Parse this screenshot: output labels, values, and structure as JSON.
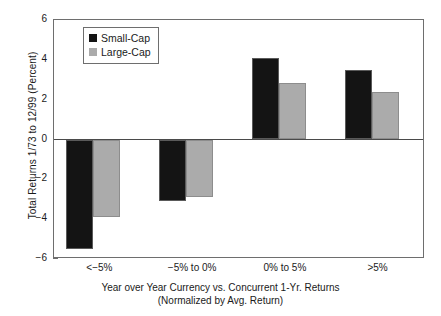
{
  "chart_data": {
    "type": "bar",
    "title": "",
    "xlabel": "Year over Year Currency vs. Concurrent 1-Yr. Returns (Normalized by Avg. Return)",
    "xlabel_line1": "Year over Year Currency vs. Concurrent 1-Yr. Returns",
    "xlabel_line2": "(Normalized by Avg. Return)",
    "ylabel": "Total Returns 1/73 to 12/99 (Percent)",
    "categories": [
      "<−5%",
      "−5% to 0%",
      "0% to 5%",
      ">5%"
    ],
    "series": [
      {
        "name": "Small-Cap",
        "color": "#141414",
        "values": [
          -5.5,
          -3.1,
          4.1,
          3.5
        ]
      },
      {
        "name": "Large-Cap",
        "color": "#ababab",
        "values": [
          -3.9,
          -2.9,
          2.85,
          2.4
        ]
      }
    ],
    "ylim": [
      -6,
      6
    ],
    "yticks": [
      6,
      4,
      2,
      0,
      -2,
      -4,
      -6
    ],
    "ytick_labels": [
      "6",
      "4",
      "2",
      "0",
      "−2",
      "−4",
      "−6"
    ],
    "grid": false,
    "legend_position": "upper-left-inside",
    "zero_line": true
  },
  "legend": {
    "entries": [
      {
        "label": "Small-Cap",
        "swatch": "small-cap"
      },
      {
        "label": "Large-Cap",
        "swatch": "large-cap"
      }
    ]
  }
}
